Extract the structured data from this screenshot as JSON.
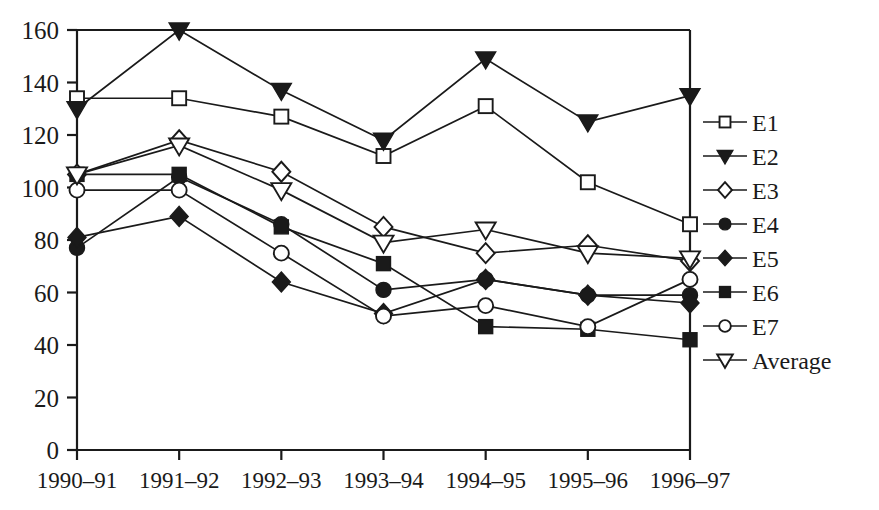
{
  "chart_data": {
    "type": "line",
    "title": "",
    "subtitle": "",
    "xlabel": "",
    "ylabel": "",
    "categories": [
      "1990–91",
      "1991–92",
      "1992–93",
      "1993–94",
      "1994–95",
      "1995–96",
      "1996–97"
    ],
    "ylim": [
      0,
      160
    ],
    "y_ticks": [
      0,
      20,
      40,
      60,
      80,
      100,
      120,
      140,
      160
    ],
    "y_tick_labels": [
      "0",
      "20",
      "40",
      "60",
      "80",
      "100",
      "120",
      "140",
      "160"
    ],
    "grid": false,
    "legend_position": "right",
    "series": [
      {
        "name": "E1",
        "marker": "open-square",
        "values": [
          134,
          134,
          127,
          112,
          131,
          102,
          86
        ]
      },
      {
        "name": "E2",
        "marker": "filled-triangle-down",
        "values": [
          130,
          160,
          137,
          118,
          149,
          125,
          135
        ]
      },
      {
        "name": "E3",
        "marker": "open-diamond",
        "values": [
          105,
          118,
          106,
          85,
          75,
          78,
          72
        ]
      },
      {
        "name": "E4",
        "marker": "filled-circle",
        "values": [
          77,
          104,
          86,
          61,
          65,
          59,
          59
        ]
      },
      {
        "name": "E5",
        "marker": "filled-diamond",
        "values": [
          81,
          89,
          64,
          52,
          65,
          59,
          56
        ]
      },
      {
        "name": "E6",
        "marker": "filled-square",
        "values": [
          105,
          105,
          85,
          71,
          47,
          46,
          42
        ]
      },
      {
        "name": "E7",
        "marker": "open-circle",
        "values": [
          99,
          99,
          75,
          51,
          55,
          47,
          65
        ]
      },
      {
        "name": "Average",
        "marker": "open-triangle-down",
        "values": [
          105,
          116,
          99,
          79,
          84,
          75,
          73
        ]
      }
    ]
  },
  "legend": {
    "entries": [
      {
        "label": "E1"
      },
      {
        "label": "E2"
      },
      {
        "label": "E3"
      },
      {
        "label": "E4"
      },
      {
        "label": "E5"
      },
      {
        "label": "E6"
      },
      {
        "label": "E7"
      },
      {
        "label": "Average"
      }
    ]
  },
  "colors": {
    "ink": "#1a1a1a",
    "background": "#ffffff",
    "marker_fill_open": "#ffffff"
  }
}
